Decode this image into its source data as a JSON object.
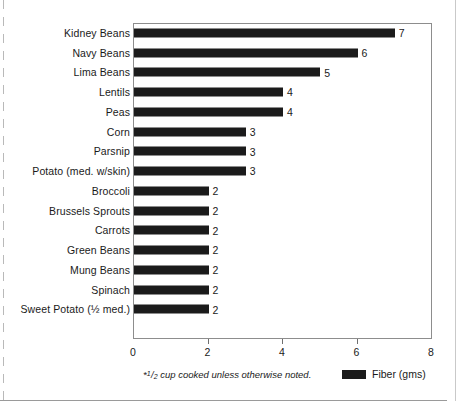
{
  "chart_data": {
    "type": "bar",
    "orientation": "horizontal",
    "title": "",
    "xlabel": "",
    "ylabel": "",
    "xlim": [
      0,
      8
    ],
    "xticks": [
      0,
      2,
      4,
      6,
      8
    ],
    "xtick_labels": [
      "0",
      "2",
      "4",
      "6",
      "8"
    ],
    "grid": false,
    "legend": {
      "position": "bottom-right",
      "entries": [
        {
          "label": "Fiber (gms)",
          "color": "#1b1b1b"
        }
      ]
    },
    "footnote": {
      "star": "*",
      "fraction_numerator": "1",
      "fraction_slash": "/",
      "fraction_denominator": "2",
      "text": "cup cooked unless otherwise noted.",
      "full": "*1/2 cup cooked unless otherwise noted."
    },
    "categories": [
      "Kidney Beans",
      "Navy Beans",
      "Lima Beans",
      "Lentils",
      "Peas",
      "Corn",
      "Parsnip",
      "Potato (med. w/skin)",
      "Broccoli",
      "Brussels Sprouts",
      "Carrots",
      "Green Beans",
      "Mung Beans",
      "Spinach",
      "Sweet Potato (½ med.)"
    ],
    "values": [
      7,
      6,
      5,
      4,
      4,
      3,
      3,
      3,
      2,
      2,
      2,
      2,
      2,
      2,
      2
    ],
    "value_labels": [
      "7",
      "6",
      "5",
      "4",
      "4",
      "3",
      "3",
      "3",
      "2",
      "2",
      "2",
      "2",
      "2",
      "2",
      "2"
    ],
    "series": [
      {
        "name": "Fiber (gms)",
        "color": "#1b1b1b",
        "values": [
          7,
          6,
          5,
          4,
          4,
          3,
          3,
          3,
          2,
          2,
          2,
          2,
          2,
          2,
          2
        ]
      }
    ]
  },
  "colors": {
    "bar": "#1b1b1b",
    "frame": "#8d8d8d",
    "text": "#1a1a1a",
    "background": "#ffffff"
  }
}
